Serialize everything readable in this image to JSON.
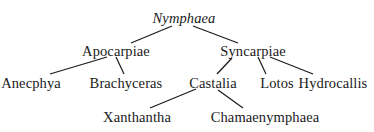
{
  "diagram": {
    "type": "taxonomic-tree",
    "line_color": "#1a1a1a",
    "text_color": "#1a1a1a",
    "background": "#ffffff",
    "nodes": [
      {
        "id": "nymphaea",
        "label": "Nymphaea",
        "italic": true,
        "x": 184,
        "y": 18,
        "parent": null
      },
      {
        "id": "apocarpiae",
        "label": "Apocarpiae",
        "italic": false,
        "x": 116,
        "y": 51,
        "parent": "nymphaea"
      },
      {
        "id": "syncarpiae",
        "label": "Syncarpiae",
        "italic": false,
        "x": 253,
        "y": 51,
        "parent": "nymphaea"
      },
      {
        "id": "anecphya",
        "label": "Anecphya",
        "italic": false,
        "x": 31,
        "y": 83,
        "parent": "apocarpiae"
      },
      {
        "id": "brachyceras",
        "label": "Brachyceras",
        "italic": false,
        "x": 126,
        "y": 83,
        "parent": "apocarpiae"
      },
      {
        "id": "castalia",
        "label": "Castalia",
        "italic": false,
        "x": 213,
        "y": 83,
        "parent": "syncarpiae"
      },
      {
        "id": "lotos",
        "label": "Lotos",
        "italic": false,
        "x": 277,
        "y": 83,
        "parent": "syncarpiae"
      },
      {
        "id": "hydrocallis",
        "label": "Hydrocallis",
        "italic": false,
        "x": 333,
        "y": 83,
        "parent": "syncarpiae"
      },
      {
        "id": "xanthantha",
        "label": "Xanthantha",
        "italic": false,
        "x": 137,
        "y": 117,
        "parent": "castalia"
      },
      {
        "id": "chamaenymphaea",
        "label": "Chamaenymphaea",
        "italic": false,
        "x": 265,
        "y": 117,
        "parent": "castalia"
      }
    ],
    "edges": [
      {
        "from": "nymphaea",
        "to": "apocarpiae",
        "x1": 172,
        "y1": 26,
        "x2": 131,
        "y2": 43
      },
      {
        "from": "nymphaea",
        "to": "syncarpiae",
        "x1": 193,
        "y1": 26,
        "x2": 238,
        "y2": 43
      },
      {
        "from": "apocarpiae",
        "to": "anecphya",
        "x1": 107,
        "y1": 57,
        "x2": 50,
        "y2": 74
      },
      {
        "from": "apocarpiae",
        "to": "brachyceras",
        "x1": 116,
        "y1": 57,
        "x2": 124,
        "y2": 74
      },
      {
        "from": "syncarpiae",
        "to": "castalia",
        "x1": 232,
        "y1": 58,
        "x2": 217,
        "y2": 74
      },
      {
        "from": "syncarpiae",
        "to": "lotos",
        "x1": 258,
        "y1": 57,
        "x2": 266,
        "y2": 74
      },
      {
        "from": "syncarpiae",
        "to": "hydrocallis",
        "x1": 270,
        "y1": 57,
        "x2": 313,
        "y2": 74
      },
      {
        "from": "castalia",
        "to": "xanthantha",
        "x1": 196,
        "y1": 89,
        "x2": 150,
        "y2": 108
      },
      {
        "from": "castalia",
        "to": "chamaenymphaea",
        "x1": 218,
        "y1": 90,
        "x2": 243,
        "y2": 108
      }
    ]
  }
}
